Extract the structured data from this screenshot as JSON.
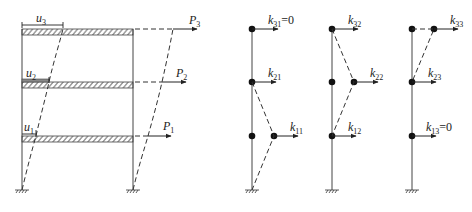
{
  "figure": {
    "type": "structural-diagram",
    "colors": {
      "line": "#333333",
      "hatch": "#555555",
      "background": "#ffffff"
    }
  },
  "frame": {
    "displacement_labels": [
      {
        "id": "u3",
        "base": "u",
        "sub": "3"
      },
      {
        "id": "u2",
        "base": "u",
        "sub": "2"
      },
      {
        "id": "u1",
        "base": "u",
        "sub": "1"
      }
    ],
    "load_labels": [
      {
        "id": "P3",
        "base": "P",
        "sub": "3"
      },
      {
        "id": "P2",
        "base": "P",
        "sub": "2"
      },
      {
        "id": "P1",
        "base": "P",
        "sub": "1"
      }
    ]
  },
  "stiffness_diagrams": [
    {
      "id": "unit-displacement-1",
      "labels": [
        {
          "base": "k",
          "sub": "31",
          "suffix": "=0"
        },
        {
          "base": "k",
          "sub": "21",
          "suffix": ""
        },
        {
          "base": "k",
          "sub": "11",
          "suffix": ""
        }
      ]
    },
    {
      "id": "unit-displacement-2",
      "labels": [
        {
          "base": "k",
          "sub": "32",
          "suffix": ""
        },
        {
          "base": "k",
          "sub": "22",
          "suffix": ""
        },
        {
          "base": "k",
          "sub": "12",
          "suffix": ""
        }
      ]
    },
    {
      "id": "unit-displacement-3",
      "labels": [
        {
          "base": "k",
          "sub": "33",
          "suffix": ""
        },
        {
          "base": "k",
          "sub": "23",
          "suffix": ""
        },
        {
          "base": "k",
          "sub": "13",
          "suffix": "=0"
        }
      ]
    }
  ]
}
